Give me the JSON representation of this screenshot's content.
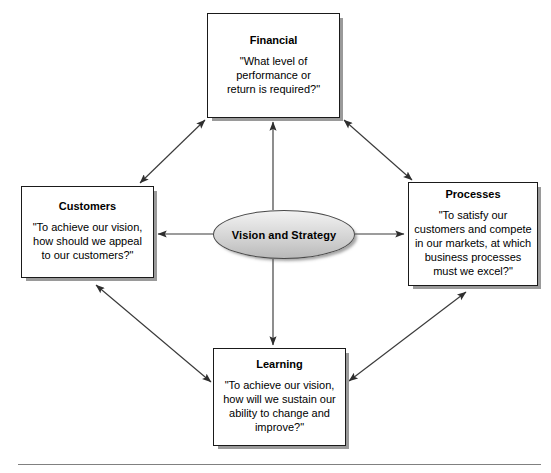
{
  "diagram": {
    "center": {
      "label": "Vision and Strategy",
      "shape": "ellipse"
    },
    "nodes": [
      {
        "key": "financial",
        "title": "Financial",
        "body": "\"What level of\nperformance or\nreturn is required?\"",
        "position": "top"
      },
      {
        "key": "customers",
        "title": "Customers",
        "body": "\"To achieve our vision,\nhow should we appeal\nto our customers?\"",
        "position": "left"
      },
      {
        "key": "processes",
        "title": "Processes",
        "body": "\"To satisfy our\ncustomers and compete\nin our markets, at which\nbusiness processes\nmust we excel?\"",
        "position": "right"
      },
      {
        "key": "learning",
        "title": "Learning",
        "body": "\"To achieve our vision,\nhow will we sustain our\nability to change and\nimprove?\"",
        "position": "bottom"
      }
    ],
    "connectors": [
      {
        "name": "center-to-financial",
        "from": "center",
        "to": "financial",
        "arrows": "single"
      },
      {
        "name": "center-to-customers",
        "from": "center",
        "to": "customers",
        "arrows": "single"
      },
      {
        "name": "center-to-processes",
        "from": "center",
        "to": "processes",
        "arrows": "single"
      },
      {
        "name": "center-to-learning",
        "from": "center",
        "to": "learning",
        "arrows": "single"
      },
      {
        "name": "customers-financial",
        "from": "customers",
        "to": "financial",
        "arrows": "double"
      },
      {
        "name": "financial-processes",
        "from": "financial",
        "to": "processes",
        "arrows": "double"
      },
      {
        "name": "customers-learning",
        "from": "customers",
        "to": "learning",
        "arrows": "double"
      },
      {
        "name": "learning-processes",
        "from": "learning",
        "to": "processes",
        "arrows": "double"
      }
    ],
    "colors": {
      "box_border": "#1a1a1a",
      "box_fill": "#ffffff",
      "box_shadow": "#9a9a9a",
      "ellipse_fill_top": "#f2f2f2",
      "ellipse_fill_bottom": "#b9b9b9",
      "ellipse_border": "#4a4a4a",
      "connector": "#3a3a3a",
      "rule": "#808080",
      "text": "#000000"
    }
  }
}
